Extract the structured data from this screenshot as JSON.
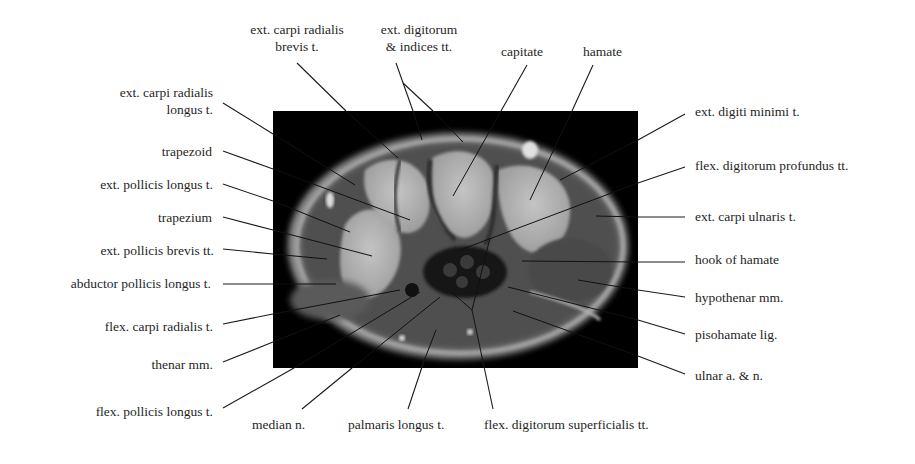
{
  "figure": {
    "type": "annotated axial MRI of the wrist (carpal tunnel level)",
    "image_box": {
      "x": 273,
      "y": 111,
      "width": 365,
      "height": 257
    },
    "colors": {
      "background": "#ffffff",
      "image_bg": "#000000",
      "leader": "#1a1a1a",
      "text": "#1f1f1f"
    }
  },
  "labels": {
    "top": [
      {
        "id": "ecrb",
        "lines": [
          "ext. carpi radialis",
          "brevis t."
        ]
      },
      {
        "id": "edi",
        "lines": [
          "ext. digitorum",
          "& indices  tt."
        ]
      },
      {
        "id": "capitate",
        "lines": [
          "capitate"
        ]
      },
      {
        "id": "hamate",
        "lines": [
          "hamate"
        ]
      }
    ],
    "left": [
      {
        "id": "ecrl",
        "lines": [
          "ext. carpi radialis",
          "longus t."
        ]
      },
      {
        "id": "trapezoid",
        "lines": [
          "trapezoid"
        ]
      },
      {
        "id": "epl",
        "lines": [
          "ext. pollicis  longus t."
        ]
      },
      {
        "id": "trapezium",
        "lines": [
          "trapezium"
        ]
      },
      {
        "id": "epb",
        "lines": [
          "ext. pollicis  brevis tt."
        ]
      },
      {
        "id": "apl",
        "lines": [
          "abductor pollicis longus t."
        ]
      },
      {
        "id": "fcr",
        "lines": [
          "flex. carpi radialis t."
        ]
      },
      {
        "id": "thenar",
        "lines": [
          "thenar  mm."
        ]
      },
      {
        "id": "fpl",
        "lines": [
          "flex. pollicis longus t."
        ]
      }
    ],
    "bottom": [
      {
        "id": "median",
        "lines": [
          "median n."
        ]
      },
      {
        "id": "pl",
        "lines": [
          "palmaris longus t."
        ]
      },
      {
        "id": "fds",
        "lines": [
          "flex. digitorum superficialis tt."
        ]
      }
    ],
    "right": [
      {
        "id": "edm",
        "lines": [
          "ext. digiti minimi t."
        ]
      },
      {
        "id": "fdp",
        "lines": [
          "flex. digitorum profundus tt."
        ]
      },
      {
        "id": "ecu",
        "lines": [
          "ext. carpi ulnaris t."
        ]
      },
      {
        "id": "hook",
        "lines": [
          "hook of hamate"
        ]
      },
      {
        "id": "hypothenar",
        "lines": [
          "hypothenar mm."
        ]
      },
      {
        "id": "pisohamate",
        "lines": [
          "pisohamate lig."
        ]
      },
      {
        "id": "ulnar",
        "lines": [
          "ulnar a. & n."
        ]
      }
    ]
  }
}
